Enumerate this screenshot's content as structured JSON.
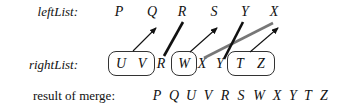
{
  "labels": {
    "left_list": "leftList:",
    "right_list": "rightList:",
    "result": "result of merge:"
  },
  "left_list": {
    "items": [
      {
        "letter": "P",
        "x": 119
      },
      {
        "letter": "Q",
        "x": 152
      },
      {
        "letter": "R",
        "x": 182
      },
      {
        "letter": "S",
        "x": 214
      },
      {
        "letter": "Y",
        "x": 245
      },
      {
        "letter": "X",
        "x": 274
      }
    ]
  },
  "right_list": {
    "items": [
      {
        "letter": "U",
        "x": 121,
        "group": "box1"
      },
      {
        "letter": "V",
        "x": 142,
        "group": "box1"
      },
      {
        "letter": "R",
        "x": 161,
        "group": "none"
      },
      {
        "letter": "W",
        "x": 183,
        "group": "box2"
      },
      {
        "letter": "X",
        "x": 202,
        "group": "none"
      },
      {
        "letter": "Y",
        "x": 221,
        "group": "none"
      },
      {
        "letter": "T",
        "x": 239,
        "group": "box3"
      },
      {
        "letter": "Z",
        "x": 261,
        "group": "box3"
      }
    ],
    "boxes": [
      {
        "id": "box1",
        "letters": "U V"
      },
      {
        "id": "box2",
        "letters": "W"
      },
      {
        "id": "box3",
        "letters": "T Z"
      }
    ]
  },
  "result": {
    "sequence": [
      "P",
      "Q",
      "U",
      "V",
      "R",
      "S",
      "W",
      "X",
      "Y",
      "T",
      "Z"
    ]
  },
  "connections": [
    {
      "from": "box U V",
      "to": "Q",
      "style": "thin-arrow",
      "color": "#111111"
    },
    {
      "from": "R",
      "to": "R",
      "style": "thick-line",
      "color": "#111111"
    },
    {
      "from": "box W",
      "to": "S",
      "style": "thin-arrow",
      "color": "#111111"
    },
    {
      "from": "X",
      "to": "X",
      "style": "thick-line",
      "color": "#777777"
    },
    {
      "from": "Y",
      "to": "Y",
      "style": "thick-line",
      "color": "#111111"
    },
    {
      "from": "box T Z",
      "to": "X",
      "style": "thin-arrow",
      "color": "#111111"
    }
  ]
}
